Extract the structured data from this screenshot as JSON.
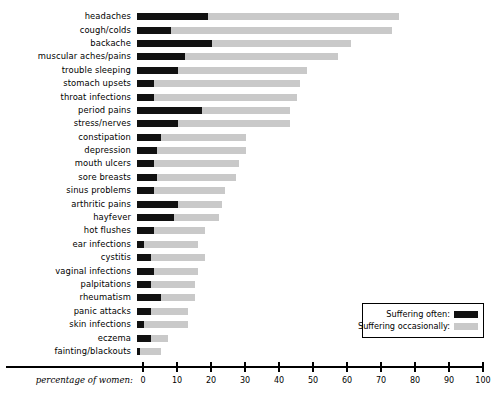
{
  "chart_data": {
    "type": "bar",
    "orientation": "horizontal",
    "stacked": true,
    "title": "",
    "xlabel": "percentage of women:",
    "ylabel": "",
    "xlim": [
      0,
      100
    ],
    "xticks": [
      0,
      10,
      20,
      30,
      40,
      50,
      60,
      70,
      80,
      90,
      100
    ],
    "xtick_labels": [
      "0",
      "10",
      "20",
      "30",
      "40",
      "50",
      "60",
      "70",
      "80",
      "90",
      "100"
    ],
    "grid": false,
    "legend_position": "bottom-right",
    "categories": [
      "headaches",
      "cough/colds",
      "backache",
      "muscular aches/pains",
      "trouble sleeping",
      "stomach upsets",
      "throat infections",
      "period pains",
      "stress/nerves",
      "constipation",
      "depression",
      "mouth ulcers",
      "sore breasts",
      "sinus problems",
      "arthritic pains",
      "hayfever",
      "hot flushes",
      "ear infections",
      "cystitis",
      "vaginal infections",
      "palpitations",
      "rheumatism",
      "panic attacks",
      "skin infections",
      "eczema",
      "fainting/blackouts"
    ],
    "series": [
      {
        "name": "Suffering often:",
        "color": "#111111",
        "values": [
          21,
          10,
          22,
          14,
          12,
          5,
          5,
          19,
          12,
          7,
          6,
          5,
          6,
          5,
          12,
          11,
          5,
          2,
          4,
          5,
          4,
          7,
          4,
          2,
          4,
          1
        ]
      },
      {
        "name": "Suffering occasionally:",
        "color": "#c9c9c9",
        "values": [
          56,
          65,
          41,
          45,
          38,
          43,
          42,
          26,
          33,
          25,
          26,
          25,
          23,
          21,
          13,
          13,
          15,
          16,
          16,
          13,
          13,
          10,
          11,
          13,
          5,
          6
        ]
      }
    ],
    "totals": [
      77,
      75,
      63,
      59,
      50,
      48,
      47,
      45,
      45,
      32,
      32,
      30,
      29,
      26,
      25,
      24,
      20,
      18,
      20,
      18,
      17,
      17,
      15,
      15,
      9,
      7
    ]
  },
  "legend": {
    "items": [
      {
        "label": "Suffering often:",
        "swatch": "#111111"
      },
      {
        "label": "Suffering occasionally:",
        "swatch": "#c9c9c9"
      }
    ]
  }
}
